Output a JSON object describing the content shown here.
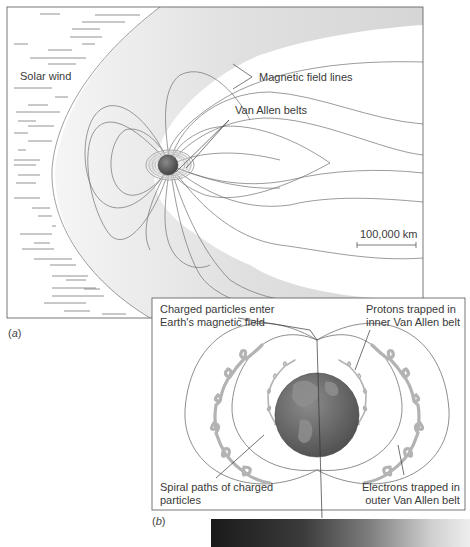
{
  "panel_a": {
    "caption_open": "(",
    "caption_letter": "a",
    "caption_close": ")",
    "labels": {
      "solar_wind": "Solar wind",
      "magnetic_field_lines": "Magnetic field lines",
      "van_allen_belts": "Van Allen belts",
      "scale_bar": "100,000 km"
    }
  },
  "panel_b": {
    "caption_open": "(",
    "caption_letter": "b",
    "caption_close": ")",
    "labels": {
      "charged_particles_line1": "Charged particles enter",
      "charged_particles_line2": "Earth's magnetic field",
      "protons_line1": "Protons trapped in",
      "protons_line2": "inner Van Allen belt",
      "spiral_line1": "Spiral paths of charged",
      "spiral_line2": "particles",
      "electrons_line1": "Electrons trapped in",
      "electrons_line2": "outer Van Allen belt"
    }
  },
  "colors": {
    "line": "#6a6a6a",
    "shading": "#d8d8d8",
    "earth": "#6b6b6b",
    "belt": "#b5b5b5"
  }
}
